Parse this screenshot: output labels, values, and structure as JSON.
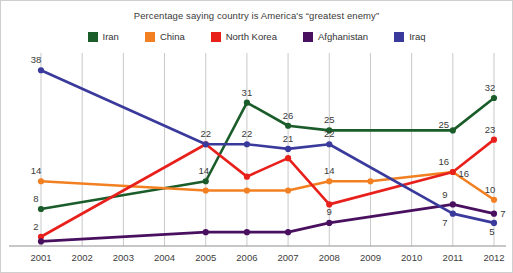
{
  "chart_data": {
    "type": "line",
    "title": "Percentage saying country is America's “greatest enemy”",
    "xlabel": "",
    "ylabel": "",
    "x": [
      2001,
      2002,
      2003,
      2004,
      2005,
      2006,
      2007,
      2008,
      2009,
      2010,
      2011,
      2012
    ],
    "tick_labels": [
      "2001",
      "2002",
      "2003",
      "2004",
      "2005",
      "2006",
      "2007",
      "2008",
      "2009",
      "2010",
      "2011",
      "2012"
    ],
    "xlim": [
      2001,
      2012
    ],
    "ylim": [
      0,
      40
    ],
    "grid": "vertical",
    "legend_position": "top-center",
    "series": [
      {
        "name": "Iran",
        "color": "#1a5c2a",
        "points": [
          {
            "x": 2001,
            "y": 8,
            "label": "8"
          },
          {
            "x": 2005,
            "y": 14,
            "label": "14"
          },
          {
            "x": 2006,
            "y": 31,
            "label": "31"
          },
          {
            "x": 2007,
            "y": 26,
            "label": "26"
          },
          {
            "x": 2008,
            "y": 25,
            "label": "25"
          },
          {
            "x": 2011,
            "y": 25,
            "label": "25"
          },
          {
            "x": 2012,
            "y": 32,
            "label": "32"
          }
        ]
      },
      {
        "name": "China",
        "color": "#f28022",
        "points": [
          {
            "x": 2001,
            "y": 14,
            "label": "14"
          },
          {
            "x": 2005,
            "y": 12,
            "label": ""
          },
          {
            "x": 2006,
            "y": 12,
            "label": ""
          },
          {
            "x": 2007,
            "y": 12,
            "label": ""
          },
          {
            "x": 2008,
            "y": 14,
            "label": "14"
          },
          {
            "x": 2009,
            "y": 14,
            "label": ""
          },
          {
            "x": 2011,
            "y": 16,
            "label": "16"
          },
          {
            "x": 2012,
            "y": 10,
            "label": "10"
          }
        ]
      },
      {
        "name": "North Korea",
        "color": "#e8201c",
        "points": [
          {
            "x": 2001,
            "y": 2,
            "label": "2"
          },
          {
            "x": 2005,
            "y": 22,
            "label": ""
          },
          {
            "x": 2006,
            "y": 15,
            "label": ""
          },
          {
            "x": 2007,
            "y": 19,
            "label": ""
          },
          {
            "x": 2008,
            "y": 9,
            "label": "9"
          },
          {
            "x": 2011,
            "y": 16,
            "label": "16"
          },
          {
            "x": 2012,
            "y": 23,
            "label": "23"
          }
        ]
      },
      {
        "name": "Afghanistan",
        "color": "#4a1060",
        "points": [
          {
            "x": 2001,
            "y": 1,
            "label": ""
          },
          {
            "x": 2005,
            "y": 3,
            "label": ""
          },
          {
            "x": 2006,
            "y": 3,
            "label": ""
          },
          {
            "x": 2007,
            "y": 3,
            "label": ""
          },
          {
            "x": 2008,
            "y": 5,
            "label": ""
          },
          {
            "x": 2011,
            "y": 9,
            "label": "9"
          },
          {
            "x": 2012,
            "y": 7,
            "label": "7"
          }
        ]
      },
      {
        "name": "Iraq",
        "color": "#3a3a9c",
        "points": [
          {
            "x": 2001,
            "y": 38,
            "label": "38"
          },
          {
            "x": 2005,
            "y": 22,
            "label": "22"
          },
          {
            "x": 2006,
            "y": 22,
            "label": "22"
          },
          {
            "x": 2007,
            "y": 21,
            "label": "21"
          },
          {
            "x": 2008,
            "y": 22,
            "label": "22"
          },
          {
            "x": 2011,
            "y": 7,
            "label": "7"
          },
          {
            "x": 2012,
            "y": 5,
            "label": "5"
          }
        ]
      }
    ],
    "annotations": [
      {
        "text": "38",
        "x": 2001,
        "y": 38
      },
      {
        "text": "14",
        "x": 2001,
        "y": 14
      },
      {
        "text": "8",
        "x": 2001,
        "y": 8
      },
      {
        "text": "2",
        "x": 2001,
        "y": 2
      },
      {
        "text": "22",
        "x": 2005,
        "y": 22
      },
      {
        "text": "14",
        "x": 2005,
        "y": 14
      },
      {
        "text": "31",
        "x": 2006,
        "y": 31
      },
      {
        "text": "22",
        "x": 2006,
        "y": 22
      },
      {
        "text": "26",
        "x": 2007,
        "y": 26
      },
      {
        "text": "21",
        "x": 2007,
        "y": 21
      },
      {
        "text": "25",
        "x": 2008,
        "y": 25
      },
      {
        "text": "22",
        "x": 2008,
        "y": 22
      },
      {
        "text": "14",
        "x": 2008,
        "y": 14
      },
      {
        "text": "9",
        "x": 2008,
        "y": 9
      },
      {
        "text": "25",
        "x": 2011,
        "y": 25
      },
      {
        "text": "16",
        "x": 2011,
        "y": 16
      },
      {
        "text": "16",
        "x": 2011,
        "y": 16
      },
      {
        "text": "9",
        "x": 2011,
        "y": 9
      },
      {
        "text": "7",
        "x": 2011,
        "y": 7
      },
      {
        "text": "32",
        "x": 2012,
        "y": 32
      },
      {
        "text": "23",
        "x": 2012,
        "y": 23
      },
      {
        "text": "10",
        "x": 2012,
        "y": 10
      },
      {
        "text": "7",
        "x": 2012,
        "y": 7
      },
      {
        "text": "5",
        "x": 2012,
        "y": 5
      }
    ]
  },
  "legend": {
    "items": [
      {
        "label": "Iran",
        "color": "#1a5c2a"
      },
      {
        "label": "China",
        "color": "#f28022"
      },
      {
        "label": "North Korea",
        "color": "#e8201c"
      },
      {
        "label": "Afghanistan",
        "color": "#4a1060"
      },
      {
        "label": "Iraq",
        "color": "#3a3a9c"
      }
    ]
  }
}
